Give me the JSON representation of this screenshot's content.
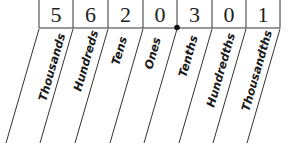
{
  "diagram": {
    "digits": [
      "5",
      "6",
      "2",
      "0",
      "3",
      "0",
      "1"
    ],
    "places": [
      "Thousands",
      "Hundreds",
      "Tens",
      "Ones",
      "Tenths",
      "Hundredths",
      "Thousandths"
    ],
    "decimal_point_after_index": 3,
    "line_color": "#333333",
    "text_color": "#1a1a1a"
  }
}
